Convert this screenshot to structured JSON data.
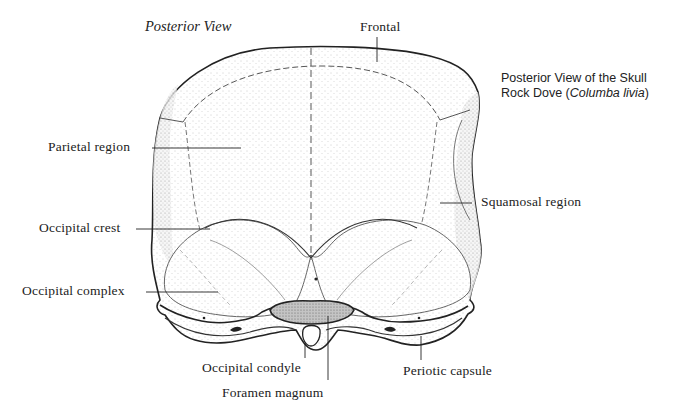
{
  "figure": {
    "view_title": "Posterior View",
    "caption": {
      "line1": "Posterior View of the Skull",
      "line2_prefix": "Rock Dove (",
      "line2_species": "Columba livia",
      "line2_suffix": ")"
    }
  },
  "labels": {
    "frontal": "Frontal",
    "parietal_region": "Parietal region",
    "squamosal_region": "Squamosal region",
    "occipital_crest": "Occipital crest",
    "occipital_complex": "Occipital complex",
    "occipital_condyle": "Occipital condyle",
    "foramen_magnum": "Foramen magnum",
    "periotic_capsule": "Periotic capsule"
  },
  "colors": {
    "ink": "#222222",
    "stipple": "#d8d8d8",
    "foramen_fill": "#bcbcbc",
    "background": "#ffffff"
  }
}
